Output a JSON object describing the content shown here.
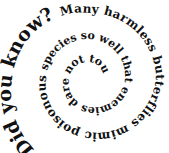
{
  "graphic": {
    "type": "spiral-text",
    "text_color": "#111111",
    "background": "#ffffff",
    "segments": [
      {
        "text": "Did you know? ",
        "style": "big"
      },
      {
        "text": "Many harmless butterflies mimic poisonous ",
        "style": "mid"
      },
      {
        "text": "species so well that enemies dare not touch them.",
        "style": "small"
      }
    ]
  }
}
